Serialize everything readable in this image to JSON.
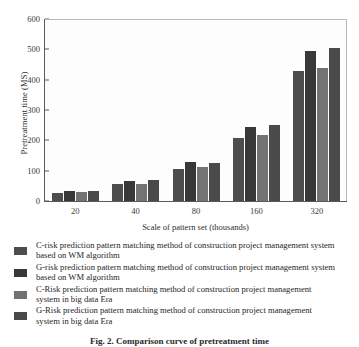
{
  "chart_data": {
    "type": "bar",
    "title": "",
    "xlabel": "Scale of pattern set (thousands)",
    "ylabel": "Pretreatment time (MS)",
    "categories": [
      "20",
      "40",
      "80",
      "160",
      "320"
    ],
    "yticks": [
      "0",
      "100",
      "200",
      "300",
      "400",
      "500",
      "600"
    ],
    "ylim": [
      0,
      600
    ],
    "grid": false,
    "legend_position": "below",
    "series": [
      {
        "name": "C-risk prediction pattern matching method of construction project management system based on WM algorithm",
        "color": "#4d4d4d",
        "values": [
          28,
          55,
          107,
          208,
          428
        ]
      },
      {
        "name": "G-risk prediction pattern matching method of construction project management system based on WM algorithm",
        "color": "#383838",
        "values": [
          34,
          65,
          127,
          243,
          493
        ]
      },
      {
        "name": "C-Risk prediction pattern matching method of construction project management system in big data Era",
        "color": "#737373",
        "values": [
          29,
          55,
          112,
          217,
          440
        ]
      },
      {
        "name": "G-Risk prediction pattern matching method of construction project management system in big data Era",
        "color": "#4a4a4a",
        "values": [
          34,
          70,
          126,
          252,
          505
        ]
      }
    ]
  },
  "legend": {
    "items": [
      {
        "label": "C-risk prediction pattern matching method of construction project management system based on WM algorithm",
        "color": "#4d4d4d"
      },
      {
        "label": "G-risk prediction pattern matching method of construction project management system based on WM algorithm",
        "color": "#383838"
      },
      {
        "label": "C-Risk prediction pattern matching method of construction project management system in big data Era",
        "color": "#737373"
      },
      {
        "label": "G-Risk prediction pattern matching method of construction project management system in big data Era",
        "color": "#4a4a4a"
      }
    ]
  },
  "caption": {
    "text": "Fig. 2.  Comparison curve of pretreatment time"
  }
}
